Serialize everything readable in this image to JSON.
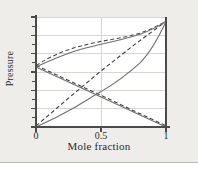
{
  "figure": {
    "background_color": "#eeedea",
    "plot_background_color": "#ffffff",
    "axis_color": "#4a4a4a",
    "grid_color": "#d6d4cf",
    "curve_color": "#6f6f6f",
    "dashed_color": "#4a4a4a"
  },
  "chart_data": {
    "type": "line",
    "title": "",
    "xlabel": "Mole fraction",
    "ylabel": "Pressure",
    "xlim": [
      0,
      1
    ],
    "ylim": [
      0,
      1
    ],
    "grid": true,
    "legend": "none",
    "xticks": [
      0,
      0.5,
      1
    ],
    "xtick_labels": [
      "0",
      "0.5",
      "1"
    ],
    "yticks": [
      0,
      0.0833,
      0.1667,
      0.25,
      0.3333,
      0.4167,
      0.5,
      0.5833,
      0.6667,
      0.75,
      0.8333,
      0.9167,
      1
    ],
    "ytick_labels": [],
    "y_gridlines": [
      0.1667,
      0.3333,
      0.5,
      0.6667,
      0.8333,
      1.0
    ],
    "x_gridlines": [
      0.5
    ],
    "series": [
      {
        "name": "total-pressure-real-solid",
        "style": "solid",
        "color": "#6f6f6f",
        "x": [
          0.0,
          0.1,
          0.2,
          0.3,
          0.4,
          0.5,
          0.6,
          0.7,
          0.8,
          0.9,
          1.0
        ],
        "y": [
          0.545,
          0.602,
          0.65,
          0.69,
          0.723,
          0.753,
          0.782,
          0.812,
          0.848,
          0.895,
          0.96
        ]
      },
      {
        "name": "total-pressure-ideal-dashed",
        "style": "dashed",
        "color": "#4a4a4a",
        "x": [
          0.0,
          0.1,
          0.2,
          0.3,
          0.4,
          0.5,
          0.6,
          0.7,
          0.8,
          0.9,
          1.0
        ],
        "y": [
          0.56,
          0.628,
          0.682,
          0.723,
          0.753,
          0.778,
          0.8,
          0.823,
          0.853,
          0.898,
          0.96
        ]
      },
      {
        "name": "partial-pressure-a-rising-solid",
        "style": "solid",
        "color": "#6f6f6f",
        "x": [
          0.0,
          0.25,
          0.5,
          0.75,
          1.0
        ],
        "y": [
          0.0,
          0.24,
          0.48,
          0.72,
          0.96
        ]
      },
      {
        "name": "partial-pressure-a-rising-dashed",
        "style": "dashed",
        "color": "#4a4a4a",
        "x": [
          0.0,
          0.25,
          0.5,
          0.75,
          1.0
        ],
        "y": [
          0.01,
          0.262,
          0.51,
          0.742,
          0.96
        ]
      },
      {
        "name": "partial-pressure-b-falling-solid",
        "style": "solid",
        "color": "#6f6f6f",
        "x": [
          0.0,
          0.25,
          0.5,
          0.75,
          1.0
        ],
        "y": [
          0.545,
          0.409,
          0.273,
          0.136,
          0.0
        ]
      },
      {
        "name": "partial-pressure-b-falling-dashed",
        "style": "dashed",
        "color": "#4a4a4a",
        "x": [
          0.0,
          0.25,
          0.5,
          0.75,
          1.0
        ],
        "y": [
          0.56,
          0.424,
          0.288,
          0.148,
          0.012
        ]
      }
    ]
  },
  "axes": {
    "xlabel": "Mole fraction",
    "ylabel": "Pressure",
    "xtick_0": "0",
    "xtick_mid": "0.5",
    "xtick_1": "1"
  }
}
